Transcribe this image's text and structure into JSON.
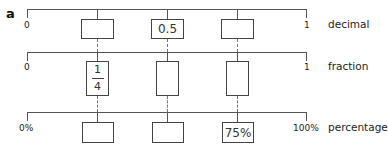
{
  "part_label": "a",
  "rows": [
    {
      "name": "decimal",
      "label": "decimal",
      "start": "0",
      "end": "1",
      "boxes": [
        "",
        "0.5",
        ""
      ]
    },
    {
      "name": "fraction",
      "label": "fraction",
      "start": "0",
      "end": "1",
      "boxes": [
        {
          "numerator": "1",
          "denominator": "4"
        },
        "",
        ""
      ]
    },
    {
      "name": "percentage",
      "label": "percentage",
      "start": "0%",
      "end": "100%",
      "boxes": [
        "",
        "",
        "75%"
      ]
    }
  ],
  "colors": {
    "line": "#555555",
    "box_border": "#444444",
    "text": "#222222"
  }
}
